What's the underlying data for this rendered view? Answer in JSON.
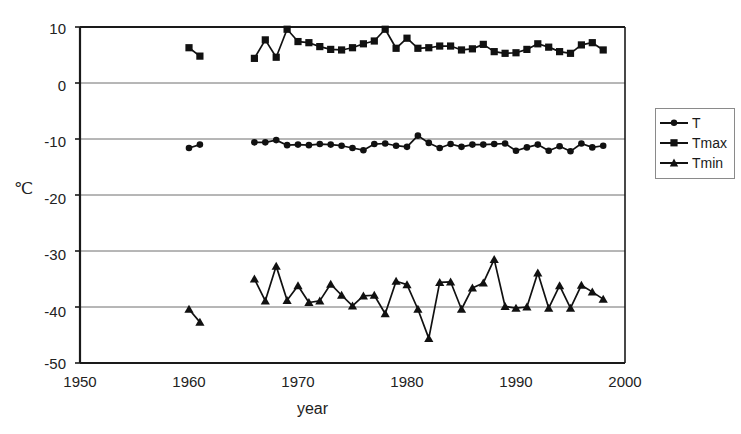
{
  "chart_data": {
    "type": "line",
    "title": "",
    "subtitle": "",
    "xlabel": "year",
    "ylabel": "℃",
    "xlim": [
      1950,
      2000
    ],
    "ylim": [
      -50,
      10
    ],
    "xticks": [
      1950,
      1960,
      1970,
      1980,
      1990,
      2000
    ],
    "yticks": [
      10,
      0,
      -10,
      -20,
      -30,
      -40,
      -50
    ],
    "grid": "horizontal",
    "legend_position": "right",
    "series": [
      {
        "name": "T",
        "marker": "circle",
        "color": "#111111",
        "points": [
          [
            1960,
            -11.6
          ],
          [
            1961,
            -11.0
          ],
          [
            1966,
            -10.6
          ],
          [
            1967,
            -10.6
          ],
          [
            1968,
            -10.2
          ],
          [
            1969,
            -11.1
          ],
          [
            1970,
            -11.0
          ],
          [
            1971,
            -11.1
          ],
          [
            1972,
            -10.9
          ],
          [
            1973,
            -11.0
          ],
          [
            1974,
            -11.2
          ],
          [
            1975,
            -11.6
          ],
          [
            1976,
            -12.0
          ],
          [
            1977,
            -10.9
          ],
          [
            1978,
            -10.8
          ],
          [
            1979,
            -11.2
          ],
          [
            1980,
            -11.4
          ],
          [
            1981,
            -9.4
          ],
          [
            1982,
            -10.7
          ],
          [
            1983,
            -11.6
          ],
          [
            1984,
            -10.9
          ],
          [
            1985,
            -11.4
          ],
          [
            1986,
            -11.0
          ],
          [
            1987,
            -11.0
          ],
          [
            1988,
            -10.9
          ],
          [
            1989,
            -10.8
          ],
          [
            1990,
            -12.1
          ],
          [
            1991,
            -11.5
          ],
          [
            1992,
            -11.0
          ],
          [
            1993,
            -12.1
          ],
          [
            1994,
            -11.3
          ],
          [
            1995,
            -12.2
          ],
          [
            1996,
            -10.8
          ],
          [
            1997,
            -11.5
          ],
          [
            1998,
            -11.2
          ]
        ]
      },
      {
        "name": "Tmax",
        "marker": "square",
        "color": "#111111",
        "points": [
          [
            1960,
            6.3
          ],
          [
            1961,
            4.8
          ],
          [
            1966,
            4.4
          ],
          [
            1967,
            7.7
          ],
          [
            1968,
            4.6
          ],
          [
            1969,
            9.6
          ],
          [
            1970,
            7.4
          ],
          [
            1971,
            7.2
          ],
          [
            1972,
            6.5
          ],
          [
            1973,
            6.0
          ],
          [
            1974,
            5.9
          ],
          [
            1975,
            6.3
          ],
          [
            1976,
            7.0
          ],
          [
            1977,
            7.5
          ],
          [
            1978,
            9.6
          ],
          [
            1979,
            6.2
          ],
          [
            1980,
            8.0
          ],
          [
            1981,
            6.2
          ],
          [
            1982,
            6.3
          ],
          [
            1983,
            6.6
          ],
          [
            1984,
            6.6
          ],
          [
            1985,
            5.9
          ],
          [
            1986,
            6.1
          ],
          [
            1987,
            6.9
          ],
          [
            1988,
            5.6
          ],
          [
            1989,
            5.3
          ],
          [
            1990,
            5.4
          ],
          [
            1991,
            6.0
          ],
          [
            1992,
            7.0
          ],
          [
            1993,
            6.4
          ],
          [
            1994,
            5.6
          ],
          [
            1995,
            5.3
          ],
          [
            1996,
            6.8
          ],
          [
            1997,
            7.2
          ],
          [
            1998,
            5.9
          ]
        ]
      },
      {
        "name": "Tmin",
        "marker": "triangle",
        "color": "#111111",
        "points": [
          [
            1960,
            -40.4
          ],
          [
            1961,
            -42.7
          ],
          [
            1966,
            -35.0
          ],
          [
            1967,
            -38.9
          ],
          [
            1968,
            -32.7
          ],
          [
            1969,
            -38.8
          ],
          [
            1970,
            -36.2
          ],
          [
            1971,
            -39.2
          ],
          [
            1972,
            -38.9
          ],
          [
            1973,
            -35.9
          ],
          [
            1974,
            -37.9
          ],
          [
            1975,
            -39.8
          ],
          [
            1976,
            -38.0
          ],
          [
            1977,
            -37.9
          ],
          [
            1978,
            -41.2
          ],
          [
            1979,
            -35.4
          ],
          [
            1980,
            -36.0
          ],
          [
            1981,
            -40.4
          ],
          [
            1982,
            -45.6
          ],
          [
            1983,
            -35.6
          ],
          [
            1984,
            -35.5
          ],
          [
            1985,
            -40.4
          ],
          [
            1986,
            -36.6
          ],
          [
            1987,
            -35.7
          ],
          [
            1988,
            -31.5
          ],
          [
            1989,
            -39.9
          ],
          [
            1990,
            -40.2
          ],
          [
            1991,
            -40.0
          ],
          [
            1992,
            -33.9
          ],
          [
            1993,
            -40.2
          ],
          [
            1994,
            -36.2
          ],
          [
            1995,
            -40.2
          ],
          [
            1996,
            -36.1
          ],
          [
            1997,
            -37.3
          ],
          [
            1998,
            -38.6
          ]
        ]
      }
    ]
  },
  "legend": {
    "items": [
      {
        "label": "T",
        "marker": "circle"
      },
      {
        "label": "Tmax",
        "marker": "square"
      },
      {
        "label": "Tmin",
        "marker": "triangle"
      }
    ]
  },
  "axes": {
    "y_title": "℃",
    "x_title": "year",
    "y_tick_labels": [
      "10",
      "0",
      "-10",
      "-20",
      "-30",
      "-40",
      "-50"
    ],
    "x_tick_labels": [
      "1950",
      "1960",
      "1970",
      "1980",
      "1990",
      "2000"
    ]
  },
  "colors": {
    "line": "#111111",
    "grid": "#6e6e6e",
    "frame": "#1a1a1a",
    "background": "#ffffff"
  }
}
